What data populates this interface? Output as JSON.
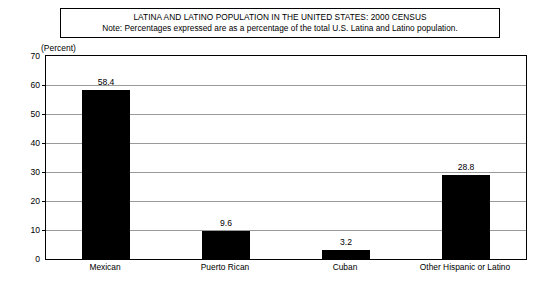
{
  "title_box": {
    "title": "LATINA AND LATINO POPULATION IN THE UNITED STATES: 2000 CENSUS",
    "note": "Note: Percentages expressed are as a percentage of the total U.S. Latina and Latino population."
  },
  "axis_unit_label": "(Percent)",
  "chart_data": {
    "type": "bar",
    "title": "LATINA AND LATINO POPULATION IN THE UNITED STATES: 2000 CENSUS",
    "subtitle": "Note: Percentages expressed are as a percentage of the total U.S. Latina and Latino population.",
    "categories": [
      "Mexican",
      "Puerto Rican",
      "Cuban",
      "Other Hispanic or Latino"
    ],
    "values": [
      58.4,
      9.6,
      3.2,
      28.8
    ],
    "value_labels": [
      "58.4",
      "9.6",
      "3.2",
      "28.8"
    ],
    "xlabel": "",
    "ylabel": "(Percent)",
    "ylim": [
      0,
      70
    ],
    "yticks": [
      0,
      10,
      20,
      30,
      40,
      50,
      60,
      70
    ],
    "ytick_labels": [
      "0",
      "10",
      "20",
      "30",
      "40",
      "50",
      "60",
      "70"
    ],
    "grid": true,
    "grid_axis": "y",
    "legend": false,
    "bar_color": "#000000",
    "grid_color": "#9a9a9a",
    "frame_color": "#000000",
    "background_color": "#ffffff"
  }
}
